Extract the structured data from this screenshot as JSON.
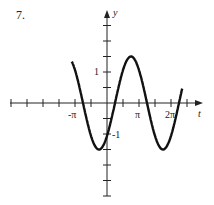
{
  "problem_number": "7.",
  "chart_data": {
    "type": "line",
    "title": "",
    "xlabel": "t",
    "ylabel": "y",
    "function_estimate": "y = 1.5 sin(t - pi/4)",
    "x_tick_labels": [
      "-π",
      "π",
      "2π"
    ],
    "y_tick_labels": [
      "1",
      "-1"
    ],
    "x_tick_spacing": "π/2",
    "y_tick_spacing": 0.5,
    "xlim": [
      "-2π",
      "2.5π"
    ],
    "ylim": [
      -3,
      3
    ],
    "x": [
      -1.1,
      -0.75,
      -0.25,
      0.25,
      0.75,
      1.25,
      1.75,
      2.25,
      2.35
    ],
    "x_units": "multiples of π",
    "values": [
      0.78,
      0,
      -1.5,
      0,
      1.5,
      0,
      -1.5,
      0,
      0.45
    ],
    "grid": false,
    "legend": null
  },
  "origin": {
    "x": 107,
    "y": 103
  },
  "scale": {
    "px_per_pi": 32,
    "px_per_unit": 31
  },
  "colors": {
    "curve": "#111111",
    "axes": "#222222"
  }
}
